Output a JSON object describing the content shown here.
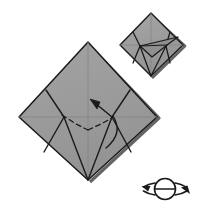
{
  "figure": {
    "kind": "origami-instruction-diagram",
    "caption": "",
    "background_color": "#ffffff",
    "paper_fill": "#9a9a9a",
    "paper_fill_light": "#a5a5a5",
    "paper_fill_dark": "#8e8e8e",
    "shadow_color": "#5d5d5d",
    "line_color": "#1a1a1a",
    "crease_color": "#8a8a8a",
    "dashed_color": "#1a1a1a"
  },
  "main_step": {
    "name": "main-step-diagram",
    "label": "Large diamond preliminary base with inside reverse fold",
    "diamond": {
      "name": "main-diamond-outline",
      "top": [
        88,
        42
      ],
      "right": [
        157,
        117
      ],
      "bottom": [
        88,
        180
      ],
      "left": [
        19,
        117
      ]
    },
    "creases": [
      {
        "name": "horizontal-center-crease",
        "from": [
          19,
          117
        ],
        "to": [
          157,
          117
        ],
        "style": "thin-gray"
      },
      {
        "name": "vertical-center-crease",
        "from": [
          88,
          42
        ],
        "to": [
          88,
          180
        ],
        "style": "thin-gray"
      }
    ],
    "folds": [
      {
        "name": "left-upper-edge-fold",
        "from": [
          46,
          90
        ],
        "to": [
          64,
          117
        ],
        "style": "solid"
      },
      {
        "name": "left-lower-edge-fold",
        "from": [
          64,
          117
        ],
        "to": [
          44,
          152
        ],
        "style": "solid"
      },
      {
        "name": "left-inner-fold",
        "from": [
          64,
          117
        ],
        "to": [
          88,
          180
        ],
        "style": "solid"
      },
      {
        "name": "right-upper-edge-fold",
        "from": [
          130,
          90
        ],
        "to": [
          112,
          117
        ],
        "style": "solid"
      },
      {
        "name": "right-lower-edge-fold",
        "from": [
          112,
          117
        ],
        "to": [
          131,
          152
        ],
        "style": "solid"
      },
      {
        "name": "right-inner-fold",
        "from": [
          112,
          117
        ],
        "to": [
          88,
          180
        ],
        "style": "solid"
      },
      {
        "name": "left-flap-edge",
        "from": [
          46,
          90
        ],
        "to": [
          46,
          90
        ],
        "style": "solid"
      }
    ],
    "valley_folds_dashed": [
      {
        "name": "dashed-valley-left",
        "from": [
          62,
          115
        ],
        "to": [
          88,
          130
        ]
      },
      {
        "name": "dashed-valley-right",
        "from": [
          88,
          130
        ],
        "to": [
          112,
          118
        ]
      }
    ],
    "arrow": {
      "name": "fold-direction-arrow",
      "from": [
        112,
        117
      ],
      "to": [
        93,
        101
      ],
      "head": "solid-triangle",
      "description": "arrow pointing up and to the left indicating reverse fold direction"
    },
    "curved_arc": {
      "name": "fold-motion-arc",
      "description": "curved arc sweeping from the right junction downward",
      "from": [
        112,
        117
      ],
      "control": [
        122,
        135
      ],
      "to": [
        107,
        148
      ]
    }
  },
  "result_step": {
    "name": "result-step-diagram",
    "label": "Resulting shape after the reverse fold",
    "diamond": {
      "name": "result-diamond-outline",
      "top": [
        151,
        13
      ],
      "right": [
        183,
        45
      ],
      "bottom": [
        151,
        76
      ],
      "left": [
        120,
        45
      ]
    },
    "creases": [
      {
        "name": "result-horizontal-crease",
        "from": [
          120,
          45
        ],
        "to": [
          183,
          45
        ],
        "style": "thin-gray"
      },
      {
        "name": "result-vertical-crease",
        "from": [
          151,
          13
        ],
        "to": [
          151,
          76
        ],
        "style": "thin-gray"
      }
    ],
    "folds": [
      {
        "name": "result-left-upper-fold",
        "from": [
          133,
          34
        ],
        "to": [
          140,
          46
        ],
        "style": "solid"
      },
      {
        "name": "result-left-lower-fold",
        "from": [
          140,
          46
        ],
        "to": [
          133,
          63
        ],
        "style": "solid"
      },
      {
        "name": "result-left-inner-fold",
        "from": [
          140,
          46
        ],
        "to": [
          151,
          76
        ],
        "style": "solid"
      },
      {
        "name": "result-right-upper-fold",
        "from": [
          170,
          34
        ],
        "to": [
          166,
          46
        ],
        "style": "solid"
      },
      {
        "name": "result-right-lower-fold",
        "from": [
          166,
          46
        ],
        "to": [
          170,
          63
        ],
        "style": "solid"
      },
      {
        "name": "result-right-inner-fold",
        "from": [
          166,
          46
        ],
        "to": [
          151,
          76
        ],
        "style": "solid"
      },
      {
        "name": "result-folded-flap-upper",
        "from": [
          140,
          46
        ],
        "to": [
          177,
          38
        ],
        "style": "solid"
      },
      {
        "name": "result-folded-flap-lower",
        "from": [
          140,
          46
        ],
        "to": [
          152,
          57
        ],
        "style": "solid"
      },
      {
        "name": "result-folded-flap-right",
        "from": [
          152,
          57
        ],
        "to": [
          170,
          44
        ],
        "style": "solid"
      }
    ]
  },
  "turn_over_symbol": {
    "name": "turn-over-symbol",
    "label": "turn over / flip the model",
    "center": [
      165,
      189
    ],
    "radius_x": 11,
    "radius_y": 9,
    "left_arrow_tip": [
      143,
      186
    ],
    "right_arrow_tip": [
      190,
      194
    ],
    "axis_line": {
      "from": [
        154,
        189
      ],
      "to": [
        176,
        189
      ]
    }
  }
}
